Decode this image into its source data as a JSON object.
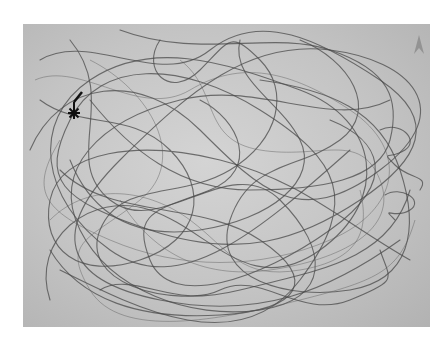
{
  "image": {
    "description": "Grayscale photograph of a dense tangled line trace (random-walk / movement path) drawn over a gray rectangular board",
    "background_color": "#ffffff",
    "panel_color": "#c6c6c6",
    "trace_color": "#4a4a4a",
    "markers": [
      {
        "name": "start-asterisk-marker",
        "glyph": "✱",
        "x": 74,
        "y": 110
      },
      {
        "name": "arrow-marker",
        "glyph": "⮝",
        "x": 418,
        "y": 44
      }
    ]
  }
}
